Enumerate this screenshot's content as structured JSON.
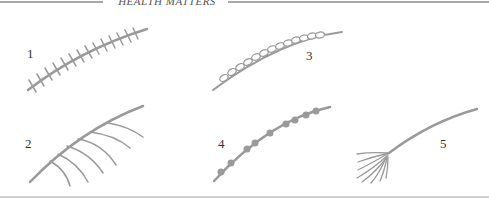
{
  "header": {
    "title": "HEALTH MATTERS"
  },
  "figure": {
    "stroke_color": "#9a9a9a",
    "items": [
      {
        "number": "1",
        "type": "crossed-ticks"
      },
      {
        "number": "2",
        "type": "arc-branches"
      },
      {
        "number": "3",
        "type": "chain-links"
      },
      {
        "number": "4",
        "type": "beaded-dots"
      },
      {
        "number": "5",
        "type": "frayed-end"
      }
    ]
  }
}
